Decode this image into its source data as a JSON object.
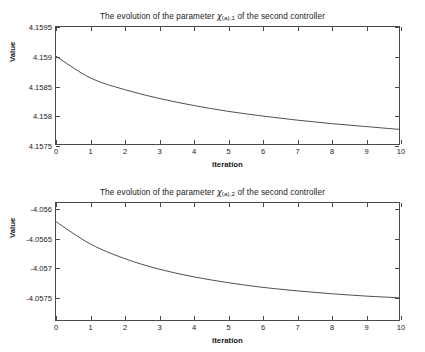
{
  "figure": {
    "background": "#ffffff",
    "axis_color": "#4a4a4a",
    "curve_color": "#3a3a3a"
  },
  "panels": [
    {
      "id": "top",
      "title_pre": "The evolution of the parameter ",
      "title_symbol": "χ",
      "title_subscript": "(a),1",
      "title_post": " of the second controller",
      "xlabel": "Iteration",
      "ylabel": "Value",
      "yticks": [
        "4.1575",
        "4.158",
        "4.1585",
        "4.159",
        "4.1595"
      ],
      "xticks": [
        "0",
        "1",
        "2",
        "3",
        "4",
        "5",
        "6",
        "7",
        "8",
        "9",
        "10"
      ]
    },
    {
      "id": "bottom",
      "title_pre": "The evolution of the parameter ",
      "title_symbol": "χ",
      "title_subscript": "(a),2",
      "title_post": " of the second controller",
      "xlabel": "Iteration",
      "ylabel": "Value",
      "yticks": [
        "-4.0575",
        "-4.057",
        "-4.0565",
        "-4.056"
      ],
      "xticks": [
        "0",
        "1",
        "2",
        "3",
        "4",
        "5",
        "6",
        "7",
        "8",
        "9",
        "10"
      ]
    }
  ],
  "chart_data": [
    {
      "type": "line",
      "title": "The evolution of the parameter χ(a),1 of the second controller",
      "xlabel": "Iteration",
      "ylabel": "Value",
      "xlim": [
        0,
        10
      ],
      "ylim": [
        4.1575,
        4.1595
      ],
      "xticks": [
        0,
        1,
        2,
        3,
        4,
        5,
        6,
        7,
        8,
        9,
        10
      ],
      "yticks": [
        4.1575,
        4.158,
        4.1585,
        4.159,
        4.1595
      ],
      "grid": false,
      "legend": null,
      "x": [
        0,
        1,
        2,
        3,
        4,
        5,
        6,
        7,
        8,
        9,
        10
      ],
      "values": [
        4.159,
        4.15863,
        4.15843,
        4.15828,
        4.15816,
        4.15806,
        4.15798,
        4.15791,
        4.15785,
        4.1578,
        4.15775
      ]
    },
    {
      "type": "line",
      "title": "The evolution of the parameter χ(a),2 of the second controller",
      "xlabel": "Iteration",
      "ylabel": "Value",
      "xlim": [
        0,
        10
      ],
      "ylim": [
        -4.0579,
        -4.0559
      ],
      "xticks": [
        0,
        1,
        2,
        3,
        4,
        5,
        6,
        7,
        8,
        9,
        10
      ],
      "yticks": [
        -4.0575,
        -4.057,
        -4.0565,
        -4.056
      ],
      "grid": false,
      "legend": null,
      "x": [
        0,
        1,
        2,
        3,
        4,
        5,
        6,
        7,
        8,
        9,
        10
      ],
      "values": [
        -4.05622,
        -4.0566,
        -4.05685,
        -4.05703,
        -4.05716,
        -4.05726,
        -4.05734,
        -4.0574,
        -4.05745,
        -4.05749,
        -4.05752
      ]
    }
  ]
}
